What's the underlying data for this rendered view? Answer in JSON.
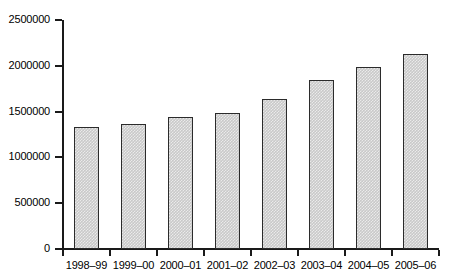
{
  "chart_data": {
    "type": "bar",
    "title": "",
    "subtitle": "",
    "xlabel": "",
    "ylabel": "",
    "categories": [
      "1998–99",
      "1999–00",
      "2000–01",
      "2001–02",
      "2002–03",
      "2003–04",
      "2004–05",
      "2005–06"
    ],
    "values": [
      1330000,
      1365000,
      1440000,
      1490000,
      1640000,
      1845000,
      1985000,
      2125000
    ],
    "ytick_labels": [
      "2500000",
      "2000000",
      "1500000",
      "1000000",
      "500000",
      "0"
    ],
    "ytick_values": [
      2500000,
      2000000,
      1500000,
      1000000,
      500000,
      0
    ],
    "ylim": [
      0,
      2500000
    ],
    "grid": false,
    "legend": false,
    "legend_position": "none",
    "bar_fill_color": "#c9c9c9",
    "bar_border_color": "#2b2b2b",
    "axis_color": "#1a1a1a",
    "background_color": "#ffffff",
    "annotations": []
  }
}
